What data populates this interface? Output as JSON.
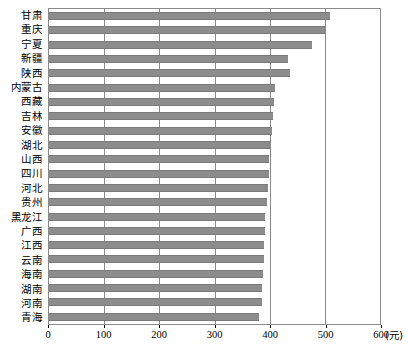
{
  "chart_data": {
    "type": "bar",
    "orientation": "horizontal",
    "title": "",
    "xlabel": "",
    "ylabel": "",
    "unit_label": "(元)",
    "xlim": [
      0,
      600
    ],
    "xticks": [
      0,
      100,
      200,
      300,
      400,
      500,
      600
    ],
    "xtick_labels": [
      "0",
      "100",
      "200",
      "300",
      "400",
      "500",
      "600"
    ],
    "grid": "vertical",
    "legend": "none",
    "bar_color": "#8c8c8c",
    "axis_color": "#8a8a8a",
    "categories": [
      "甘肃",
      "重庆",
      "宁夏",
      "新疆",
      "陕西",
      "内蒙古",
      "西藏",
      "吉林",
      "安徽",
      "湖北",
      "山西",
      "四川",
      "河北",
      "贵州",
      "黑龙江",
      "广西",
      "江西",
      "云南",
      "海南",
      "湖南",
      "河南",
      "青海"
    ],
    "values": [
      510,
      500,
      477,
      434,
      436,
      410,
      408,
      406,
      404,
      400,
      399,
      398,
      397,
      396,
      392,
      391,
      390,
      389,
      388,
      387,
      386,
      380
    ]
  }
}
